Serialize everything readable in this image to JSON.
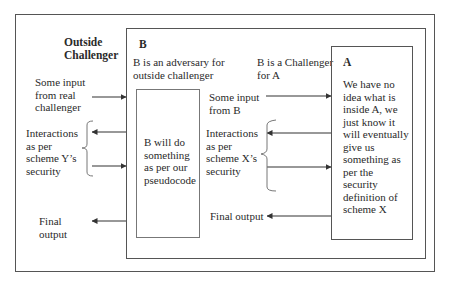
{
  "diagram": {
    "outer": {
      "title": "Outside\nChallenger",
      "labels": {
        "input": "Some input\nfrom real\nchallenger",
        "interactions": "Interactions\nas per\nscheme Y’s\nsecurity",
        "final_output": "Final\noutput"
      }
    },
    "b_box": {
      "title": "B",
      "description": "B is an adversary for\noutside challenger",
      "challenger_note": "B is a Challenger\nfor A",
      "pseudocode_box": "B will do\nsomething\nas per our\npseudocode",
      "labels": {
        "input": "Some input\nfrom B",
        "interactions": "Interactions\nas per\nscheme X’s\nsecurity",
        "final_output": "Final output"
      }
    },
    "a_box": {
      "title": "A",
      "description": "We have no\nidea what is\ninside A, we\njust know it\nwill eventually\ngive us\nsomething as\nper the\nsecurity\ndefinition of\nscheme X"
    },
    "colors": {
      "border": "#555555",
      "arrow": "#333333",
      "text": "#2a2a2a"
    }
  }
}
